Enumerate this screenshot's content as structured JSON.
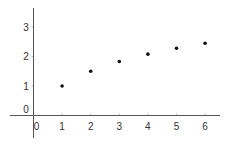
{
  "chart_data": {
    "type": "scatter",
    "title": "",
    "xlabel": "",
    "ylabel": "",
    "x": [
      1,
      2,
      3,
      4,
      5,
      6
    ],
    "series": [
      {
        "name": "points",
        "values": [
          1.0,
          1.5,
          1.83,
          2.08,
          2.28,
          2.45
        ]
      }
    ],
    "xticks": [
      "0",
      "1",
      "2",
      "3",
      "4",
      "5",
      "6"
    ],
    "yticks": [
      "0",
      "1",
      "2",
      "3"
    ],
    "xlim": [
      -0.9,
      6.5
    ],
    "ylim": [
      -0.8,
      3.6
    ],
    "grid": false,
    "legend": "none",
    "colors": {
      "axis": "#555555",
      "point": "#111111",
      "text": "#333333"
    }
  }
}
